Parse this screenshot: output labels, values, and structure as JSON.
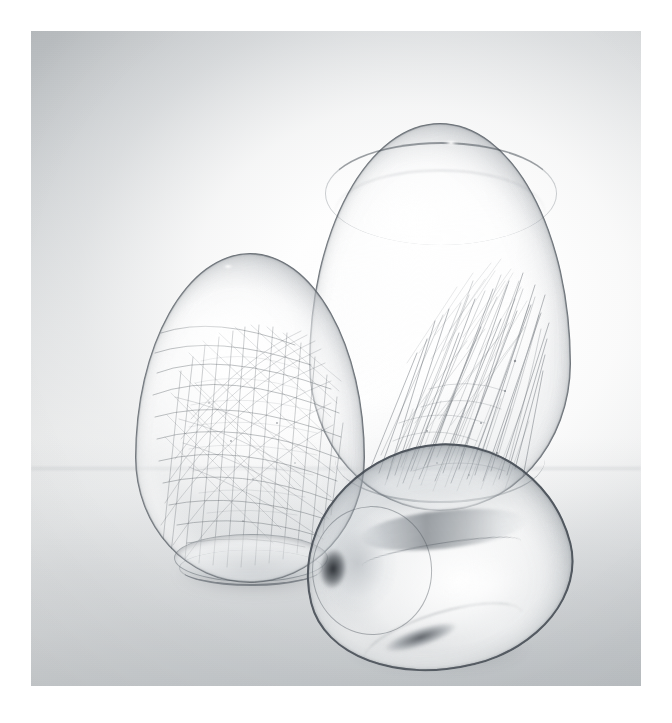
{
  "image": {
    "title": "Three transparent glass egg-shaped vessels",
    "medium": "black-and-white studio photograph",
    "canvas": {
      "width": 672,
      "height": 723,
      "background_color": "#ffffff"
    },
    "plate": {
      "name": "photographic print area",
      "left": 31,
      "top": 31,
      "width": 610,
      "height": 655,
      "border": "white paper margin on all four sides"
    }
  },
  "background": {
    "description": "seamless studio backdrop, luminous white pool behind the subjects falling off to mid grey at the upper-left, lower-left and all outer corners",
    "colors": {
      "corner_top_left": "#b4b8bb",
      "corner_top_right": "#dfe1e2",
      "corner_bottom_left": "#c2c6c9",
      "corner_bottom_right": "#c9ccce",
      "hot_centre": "#ffffff",
      "table_band": "#a8adb2",
      "horizon_line": "#929aa0"
    },
    "horizon_position_percent": 66.5,
    "grain": "fine silver-halide film grain across the whole plate",
    "vignette": true
  },
  "objects": [
    {
      "id": "egg-left",
      "name": "left upright glass egg",
      "pose": "standing upright, narrow end up",
      "contents": "dense tangled web of very fine dark filaments filling the whole interior",
      "fiber_count": 170,
      "fiber_color": "#4a5158",
      "features": [
        "flat ground base ring",
        "thin dark outline",
        "bright specular highlight on upper-left shoulder",
        "second glass rim visible through the body"
      ],
      "bounds": {
        "left": 104,
        "top": 222,
        "width": 230,
        "height": 330
      },
      "z": 3
    },
    {
      "id": "egg-tall",
      "name": "tall rear glass egg",
      "pose": "standing upright, narrow end up, set back and to the right",
      "contents": "upward-streaming bundle of fine filaments sweeping diagonally from lower-left to upper-right",
      "fiber_count": 150,
      "fiber_color": "#555c63",
      "features": [
        "dark band encircling the crown",
        "tiny white pinpoint highlight at the apex",
        "darkened shoulder edge",
        "soft arc along the base"
      ],
      "bounds": {
        "left": 278,
        "top": 92,
        "width": 262,
        "height": 388
      },
      "z": 2
    },
    {
      "id": "egg-lying",
      "name": "front glass egg lying on its side",
      "pose": "tipped over onto its side, mouth facing left, rotated about 14 degrees",
      "contents": "empty — clear glass showing reflections of the other two eggs",
      "fiber_count": 0,
      "fiber_color": "#000000",
      "features": [
        "heavy dark contour line",
        "elliptical mouth opening at the left",
        "black blob reflection inside the mouth",
        "long horizontal interior fold / caustic streak",
        "dark lozenge reflection on the lower belly"
      ],
      "bounds": {
        "left": 272,
        "top": 414,
        "width": 268,
        "height": 226
      },
      "rotation_deg": -14,
      "z": 4
    }
  ],
  "shadows": [
    {
      "name": "left egg contact shadow",
      "left": 128,
      "top": 520,
      "width": 190,
      "height": 46
    },
    {
      "name": "tall egg contact shadow",
      "left": 312,
      "top": 448,
      "width": 200,
      "height": 44
    },
    {
      "name": "lying egg contact shadow",
      "left": 292,
      "top": 588,
      "width": 230,
      "height": 58
    }
  ],
  "palette": {
    "glass_outline": "#4a5158",
    "glass_body_light": "#f4f6f7",
    "glass_body_shade": "#c4cace",
    "deep_accent": "#1c2025",
    "highlight": "#ffffff"
  }
}
